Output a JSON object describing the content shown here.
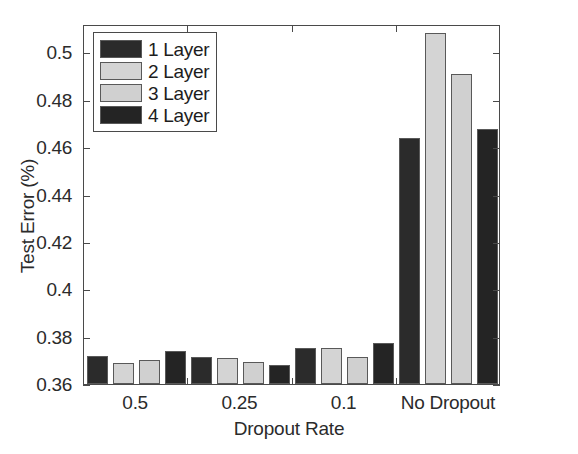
{
  "chart_data": {
    "type": "bar",
    "title": "",
    "xlabel": "Dropout Rate",
    "ylabel": "Test Error (%)",
    "categories": [
      "0.5",
      "0.25",
      "0.1",
      "No Dropout"
    ],
    "series": [
      {
        "name": "1 Layer",
        "color": "#2b2b2b",
        "values": [
          0.372,
          0.3712,
          0.3752,
          0.464
        ]
      },
      {
        "name": "2 Layer",
        "color": "#d4d4d4",
        "values": [
          0.369,
          0.371,
          0.3751,
          0.5082
        ]
      },
      {
        "name": "3 Layer",
        "color": "#d0d0d0",
        "values": [
          0.3702,
          0.3692,
          0.3712,
          0.491
        ]
      },
      {
        "name": "4 Layer",
        "color": "#242424",
        "values": [
          0.374,
          0.3682,
          0.3772,
          0.4675
        ]
      }
    ],
    "ylim": [
      0.36,
      0.512
    ],
    "yticks": [
      0.36,
      0.38,
      0.4,
      0.42,
      0.44,
      0.46,
      0.48,
      0.5
    ],
    "ytick_labels": [
      "0.36",
      "0.38",
      "0.4",
      "0.42",
      "0.44",
      "0.46",
      "0.48",
      "0.5"
    ],
    "grid": false,
    "legend_position": "upper-left",
    "axis_color": "#4a4a4a",
    "background": "#ffffff"
  },
  "axes": {
    "ylabel": "Test Error (%)",
    "xlabel": "Dropout Rate"
  },
  "legend": {
    "items": [
      {
        "label": "1 Layer"
      },
      {
        "label": "2 Layer"
      },
      {
        "label": "3 Layer"
      },
      {
        "label": "4 Layer"
      }
    ]
  }
}
